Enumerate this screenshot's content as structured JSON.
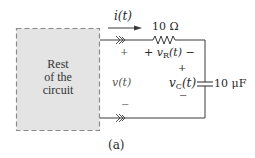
{
  "figure": {
    "caption": "(a)",
    "block": {
      "lines": [
        "Rest",
        "of the",
        "circuit"
      ],
      "fill": "#e4e4e4",
      "border": "#8a8a8a"
    },
    "current": {
      "label": "i(t)"
    },
    "resistor": {
      "value": "10 Ω",
      "voltage_label": "v",
      "voltage_sub": "R",
      "voltage_arg": "(t)",
      "plus": "+",
      "minus": "−"
    },
    "capacitor": {
      "value": "10 μF",
      "voltage_label": "v",
      "voltage_sub": "C",
      "voltage_arg": "(t)",
      "plus": "+",
      "minus": "−"
    },
    "terminal_voltage": {
      "label": "v(t)",
      "plus": "+",
      "minus": "−"
    },
    "wire_color": "#3a3a3a"
  }
}
